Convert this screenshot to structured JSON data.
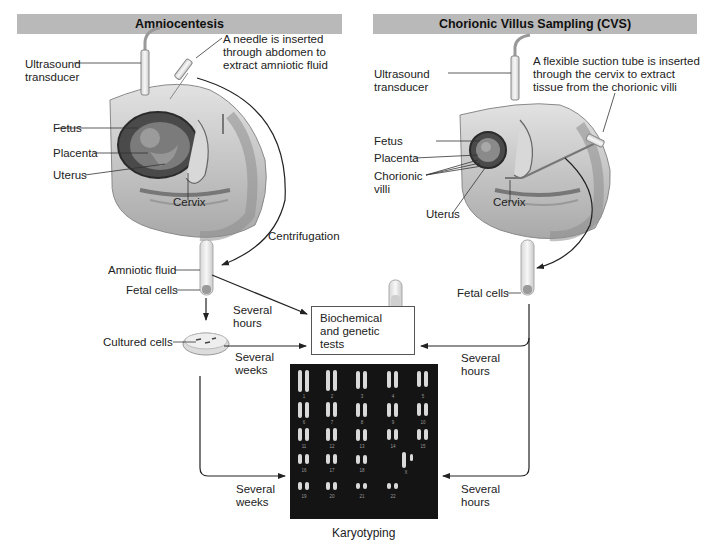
{
  "headers": {
    "left": "Amniocentesis",
    "right": "Chorionic Villus Sampling (CVS)"
  },
  "amniocentesis": {
    "ultrasound": [
      "Ultrasound",
      "transducer"
    ],
    "needle_note": [
      "A needle is inserted",
      "through abdomen to",
      "extract amniotic fluid"
    ],
    "fetus": "Fetus",
    "placenta": "Placenta",
    "uterus": "Uterus",
    "cervix": "Cervix",
    "centrifugation": "Centrifugation",
    "amniotic_fluid": "Amniotic fluid",
    "fetal_cells": "Fetal cells",
    "cultured_cells": "Cultured cells",
    "to_tests_time": [
      "Several",
      "hours"
    ],
    "culture_to_tests_time": [
      "Several",
      "weeks"
    ],
    "culture_to_karyo_time": [
      "Several",
      "weeks"
    ]
  },
  "cvs": {
    "ultrasound": [
      "Ultrasound",
      "transducer"
    ],
    "tube_note": [
      "A flexible suction tube is inserted",
      "through the cervix to extract",
      "tissue from the chorionic villi"
    ],
    "fetus": "Fetus",
    "placenta": "Placenta",
    "chorionic_villi": [
      "Chorionic",
      "villi"
    ],
    "uterus": "Uterus",
    "cervix": "Cervix",
    "fetal_cells": "Fetal cells",
    "to_tests_time": [
      "Several",
      "hours"
    ],
    "to_karyo_time": [
      "Several",
      "hours"
    ]
  },
  "tests": {
    "label": [
      "Biochemical",
      "and genetic",
      "tests"
    ]
  },
  "karyotype": {
    "caption": "Karyotyping",
    "rows": [
      [
        "1",
        "2",
        "3",
        "4",
        "5"
      ],
      [
        "6",
        "7",
        "8",
        "9",
        "10"
      ],
      [
        "11",
        "12",
        "13",
        "14",
        "15"
      ],
      [
        "16",
        "17",
        "18",
        "",
        "X"
      ],
      [
        "19",
        "20",
        "21",
        "22",
        ""
      ]
    ]
  },
  "colors": {
    "header_bg": "#b9b9b9",
    "arrow": "#222222",
    "anatomy_skin": "#c8c8c8",
    "karyotype_bg": "#141414"
  }
}
